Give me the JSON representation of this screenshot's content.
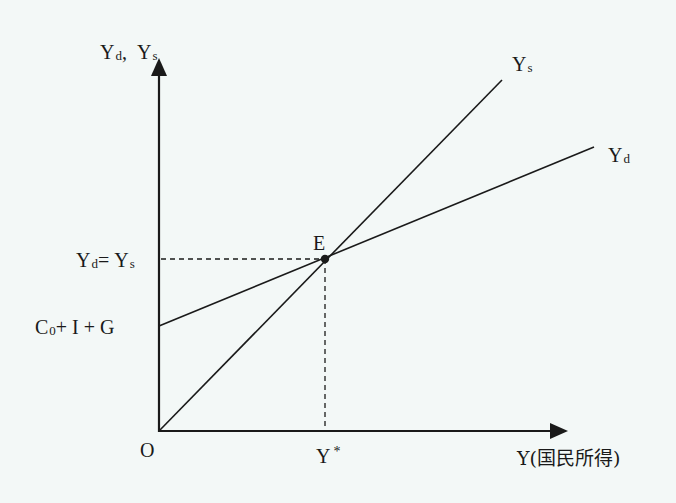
{
  "diagram": {
    "type": "keynesian-cross",
    "colors": {
      "background": "#f3f8f7",
      "ink": "#1a1a1a"
    },
    "axes": {
      "y_label": {
        "main1": "Y",
        "sub1": "d",
        "sep": ",",
        "main2": "Y",
        "sub2": "s"
      },
      "x_label": {
        "main": "Y",
        "paren": "(国民所得)"
      },
      "origin_label": "O"
    },
    "lines": [
      {
        "name": "Ys",
        "label_main": "Y",
        "label_sub": "s",
        "description": "45-degree supply line through origin"
      },
      {
        "name": "Yd",
        "label_main": "Y",
        "label_sub": "d",
        "description": "aggregate demand line with intercept C0 + I + G"
      }
    ],
    "intercept_label": {
      "c": "C",
      "sub": "0",
      "rest": "+ I + G"
    },
    "equilibrium": {
      "point_label": "E",
      "y_label": {
        "m1": "Y",
        "s1": "d",
        "eq": "=",
        "m2": "Y",
        "s2": "s"
      },
      "x_label": {
        "main": "Y",
        "sup": "*"
      }
    }
  }
}
